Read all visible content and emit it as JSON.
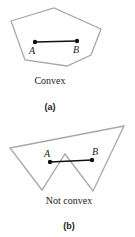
{
  "colors": {
    "polygon": "#a8a8a8",
    "segment": "#111111",
    "text": "#222222"
  },
  "figures": [
    {
      "id": "a",
      "polygon_points": "11,21 54,8 101,29 91,55 67,66 25,60",
      "point_a": {
        "label": "A",
        "x": 35,
        "y": 42
      },
      "point_b": {
        "label": "B",
        "x": 77,
        "y": 41
      },
      "caption": "Convex",
      "panel_label": "(a)"
    },
    {
      "id": "b",
      "polygon_points": "10,148 124,126 93,191 65,154 42,190",
      "point_a": {
        "label": "A",
        "x": 50,
        "y": 162
      },
      "point_b": {
        "label": "B",
        "x": 92,
        "y": 160
      },
      "caption": "Not convex",
      "panel_label": "(b)"
    }
  ]
}
